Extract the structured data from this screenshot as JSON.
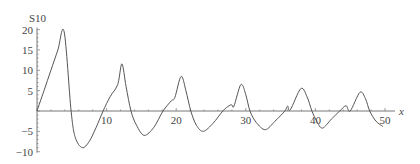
{
  "chart_data": {
    "type": "line",
    "title": "",
    "xlabel": "x",
    "ylabel": "S10",
    "xlim": [
      0,
      50
    ],
    "ylim": [
      -10,
      20
    ],
    "grid": false,
    "legend": null,
    "x_ticks": [
      10,
      20,
      30,
      40,
      50
    ],
    "y_ticks": [
      -10,
      -5,
      5,
      10,
      15,
      20
    ],
    "x_tick_labels": [
      "10",
      "20",
      "30",
      "40",
      "50"
    ],
    "y_tick_labels": [
      "-10",
      "-5",
      "5",
      "10",
      "15",
      "20"
    ],
    "series": [
      {
        "name": "S10",
        "x": [
          0,
          1,
          2,
          3,
          3.9,
          4.9,
          5.5,
          6.5,
          7.5,
          8.5,
          9.5,
          10.5,
          11.6,
          12.2,
          12.8,
          13.5,
          14.3,
          15.4,
          16.8,
          18.1,
          19.3,
          19.8,
          20.7,
          21.4,
          22.1,
          22.9,
          23.9,
          25.3,
          26.7,
          27.6,
          28.0,
          28.3,
          29.3,
          30.0,
          30.6,
          31.5,
          32.8,
          34.2,
          35.6,
          36.0,
          36.4,
          37.9,
          38.8,
          39.5,
          40.2,
          41.0,
          42.3,
          43.5,
          44.4,
          45.0,
          46.4,
          47.2,
          47.8,
          48.7,
          49.7
        ],
        "values": [
          0,
          5,
          10,
          15,
          19.5,
          0,
          -6.5,
          -9,
          -7.5,
          -4,
          0,
          3.5,
          6.5,
          11.6,
          6,
          0,
          -3.5,
          -6,
          -4,
          0,
          2.5,
          3.3,
          8.5,
          5,
          0,
          -3.5,
          -5,
          -3,
          0,
          1.3,
          1.5,
          1.2,
          6.5,
          4,
          0,
          -2.8,
          -4.6,
          -2.5,
          0,
          1.2,
          0.3,
          5.5,
          3.5,
          0,
          -2.5,
          -4.2,
          -2,
          0,
          1.3,
          0,
          4.6,
          3,
          0,
          -2.5,
          -3.8
        ]
      }
    ]
  },
  "labels": {
    "ylabel": "S10",
    "xlabel": "x"
  }
}
